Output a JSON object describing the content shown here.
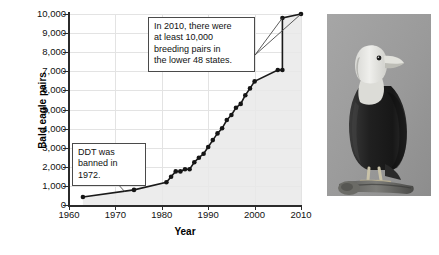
{
  "figure": {
    "background_color": "#ffffff",
    "line_color": "#1a1a1a",
    "grid_color": "#e3e3e3",
    "shade_color": "#e9e9e9"
  },
  "chart_data": {
    "type": "line",
    "title": "",
    "xlabel": "Year",
    "ylabel": "Bald eagle pairs",
    "xlim": [
      1960,
      2010
    ],
    "ylim": [
      0,
      10000
    ],
    "grid": true,
    "legend": "none",
    "x_ticks": [
      "1960",
      "1970",
      "1980",
      "1990",
      "2000",
      "2010"
    ],
    "x_tick_values": [
      1960,
      1970,
      1980,
      1990,
      2000,
      2010
    ],
    "y_ticks": [
      "0",
      "1,000",
      "2,000",
      "3,000",
      "4,000",
      "5,000",
      "6,000",
      "7,000",
      "8,000",
      "9,000",
      "10,000"
    ],
    "y_tick_values": [
      0,
      1000,
      2000,
      3000,
      4000,
      5000,
      6000,
      7000,
      8000,
      9000,
      10000
    ],
    "series": [
      {
        "name": "Bald eagle breeding pairs in the lower 48 states",
        "x": [
          1963,
          1974,
          1981,
          1982,
          1983,
          1984,
          1985,
          1986,
          1987,
          1988,
          1989,
          1990,
          1991,
          1992,
          1993,
          1994,
          1995,
          1996,
          1997,
          1998,
          1999,
          2000,
          2005,
          2006,
          2006,
          2010
        ],
        "values": [
          417,
          791,
          1188,
          1480,
          1757,
          1757,
          1875,
          1875,
          2238,
          2475,
          2680,
          3035,
          3399,
          3749,
          4015,
          4449,
          4712,
          5094,
          5295,
          5748,
          6104,
          6471,
          7066,
          7066,
          9789,
          10000
        ]
      }
    ],
    "annotations": [
      {
        "id": "annotation-2010",
        "text": "In 2010, there were at least 10,000 breeding pairs in the lower 48 states.",
        "lines": [
          "In 2010, there were",
          "at least 10,000",
          "breeding pairs in",
          "the lower 48 states."
        ],
        "points_to": [
          {
            "x": 2006,
            "y": 9789
          },
          {
            "x": 2010,
            "y": 10000
          }
        ]
      },
      {
        "id": "annotation-ddt",
        "text": "DDT was banned in 1972.",
        "lines": [
          "DDT was",
          "banned in 1972."
        ],
        "points_to": [
          {
            "x": 1972,
            "y": 700
          }
        ]
      }
    ]
  },
  "photo": {
    "caption": "",
    "alt": "Bald eagle perched on a branch, photographed against a gray background",
    "subject": "bald-eagle"
  }
}
